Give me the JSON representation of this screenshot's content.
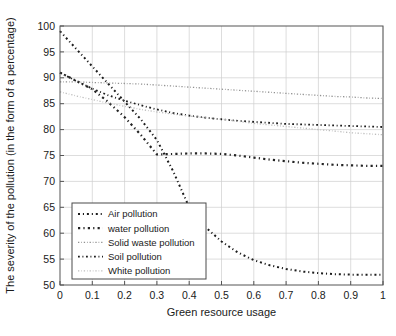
{
  "chart_data": {
    "type": "line",
    "title": "",
    "xlabel": "Green resource usage",
    "ylabel": "The severity of the pollution (in the form of a percentage)",
    "xlim": [
      0,
      1
    ],
    "ylim": [
      50,
      100
    ],
    "xticks": [
      "0",
      "0.1",
      "0.2",
      "0.3",
      "0.4",
      "0.5",
      "0.6",
      "0.7",
      "0.8",
      "0.9",
      "1"
    ],
    "xtick_values": [
      0,
      0.1,
      0.2,
      0.3,
      0.4,
      0.5,
      0.6,
      0.7,
      0.8,
      0.9,
      1
    ],
    "yticks": [
      "50",
      "55",
      "60",
      "65",
      "70",
      "75",
      "80",
      "85",
      "90",
      "95",
      "100"
    ],
    "ytick_values": [
      50,
      55,
      60,
      65,
      70,
      75,
      80,
      85,
      90,
      95,
      100
    ],
    "grid": true,
    "legend_position": "lower-left",
    "x": [
      0,
      0.05,
      0.1,
      0.15,
      0.2,
      0.25,
      0.3,
      0.35,
      0.4,
      0.45,
      0.5,
      0.55,
      0.6,
      0.65,
      0.7,
      0.75,
      0.8,
      0.85,
      0.9,
      0.95,
      1
    ],
    "series": [
      {
        "name": "Air pollution",
        "color": "#1c1c1c",
        "linestyle": "dashdot",
        "width": 2.0,
        "values": [
          99.0,
          95.6,
          92.2,
          88.8,
          85.4,
          82.0,
          78.0,
          72.0,
          65.0,
          61.2,
          58.4,
          56.3,
          54.8,
          53.8,
          53.1,
          52.6,
          52.3,
          52.1,
          52.0,
          52.0,
          52.0
        ]
      },
      {
        "name": "water pollution",
        "color": "#242424",
        "linestyle": "dashdot",
        "width": 2.2,
        "values": [
          91.0,
          89.4,
          87.8,
          85.3,
          82.4,
          79.0,
          75.2,
          75.3,
          75.4,
          75.4,
          75.3,
          75.0,
          74.6,
          74.2,
          73.9,
          73.6,
          73.4,
          73.2,
          73.1,
          73.0,
          73.0
        ]
      },
      {
        "name": "Solid waste pollution",
        "color": "#909090",
        "linestyle": "dashdot",
        "width": 1.3,
        "values": [
          89.2,
          89.2,
          89.1,
          89.0,
          88.9,
          88.8,
          88.6,
          88.4,
          88.2,
          88.0,
          87.8,
          87.6,
          87.4,
          87.2,
          87.0,
          86.8,
          86.6,
          86.4,
          86.3,
          86.1,
          86.0
        ]
      },
      {
        "name": "Soil pollution",
        "color": "#1c1c1c",
        "linestyle": "dashdot",
        "width": 1.8,
        "values": [
          91.0,
          89.4,
          87.9,
          86.6,
          85.6,
          84.7,
          83.9,
          83.2,
          82.7,
          82.3,
          82.0,
          81.7,
          81.5,
          81.3,
          81.1,
          81.0,
          80.9,
          80.8,
          80.7,
          80.6,
          80.5
        ]
      },
      {
        "name": "White pollution",
        "color": "#bdbdbd",
        "linestyle": "dashdot",
        "width": 1.3,
        "values": [
          87.3,
          86.5,
          85.8,
          85.1,
          84.5,
          83.9,
          83.4,
          83.0,
          82.6,
          82.3,
          82.0,
          81.6,
          81.2,
          80.9,
          80.6,
          80.3,
          80.0,
          79.7,
          79.4,
          79.2,
          79.0
        ]
      }
    ]
  },
  "caption": {
    "text": ""
  }
}
